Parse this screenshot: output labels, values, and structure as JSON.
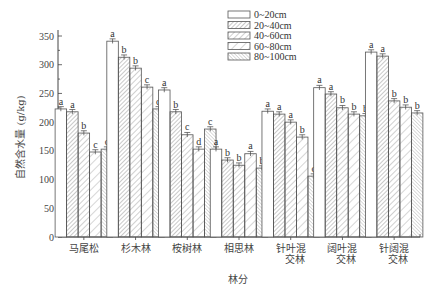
{
  "chart_data": {
    "type": "bar",
    "title": "",
    "xlabel": "林分",
    "ylabel": "自然含水量 (g/kg)",
    "ylim": [
      0,
      370
    ],
    "yticks": [
      0,
      50,
      100,
      150,
      200,
      250,
      300,
      350
    ],
    "grid": false,
    "legend_position": "top-center-right",
    "categories": [
      "马尾松",
      "杉木林",
      "桉树林",
      "相思林",
      "针叶混交林",
      "阔叶混交林",
      "针阔混交林"
    ],
    "category_display": [
      [
        "马尾松"
      ],
      [
        "杉木林"
      ],
      [
        "桉树林"
      ],
      [
        "相思林"
      ],
      [
        "针叶混",
        "交林"
      ],
      [
        "阔叶混",
        "交林"
      ],
      [
        "针阔混",
        "交林"
      ]
    ],
    "series": [
      {
        "name": "0~20cm",
        "pattern": "blank",
        "values": [
          223,
          341,
          256,
          153,
          219,
          260,
          322
        ],
        "letters": [
          "a",
          "a",
          "a",
          "a",
          "a",
          "a",
          "a"
        ]
      },
      {
        "name": "20~40cm",
        "pattern": "dense-hatch",
        "values": [
          218,
          313,
          218,
          134,
          214,
          249,
          315
        ],
        "letters": [
          "a",
          "b",
          "b",
          "b",
          "a",
          "a",
          "a"
        ]
      },
      {
        "name": "40~60cm",
        "pattern": "hatch",
        "values": [
          181,
          294,
          178,
          125,
          200,
          225,
          237
        ],
        "letters": [
          "b",
          "b",
          "c",
          "b",
          "a",
          "b",
          "b"
        ]
      },
      {
        "name": "60~80cm",
        "pattern": "wide-hatch",
        "values": [
          148,
          261,
          153,
          145,
          174,
          214,
          226
        ],
        "letters": [
          "c",
          "c",
          "d",
          "a",
          "b",
          "b",
          "b"
        ]
      },
      {
        "name": "80~100cm",
        "pattern": "cross-dense",
        "values": [
          153,
          223,
          188,
          120,
          106,
          211,
          216
        ],
        "letters": [
          "c",
          "d",
          "c",
          "b",
          "c",
          "b",
          "b"
        ]
      }
    ],
    "error_bar_approx": 4
  },
  "labels": {
    "xlabel": "林分",
    "ylabel_main": "自然含水量",
    "ylabel_unit": "(g/kg)"
  },
  "legend": {
    "items": [
      {
        "label": "0~20cm"
      },
      {
        "label": "20~40cm"
      },
      {
        "label": "40~60cm"
      },
      {
        "label": "60~80cm"
      },
      {
        "label": "80~100cm"
      }
    ]
  }
}
